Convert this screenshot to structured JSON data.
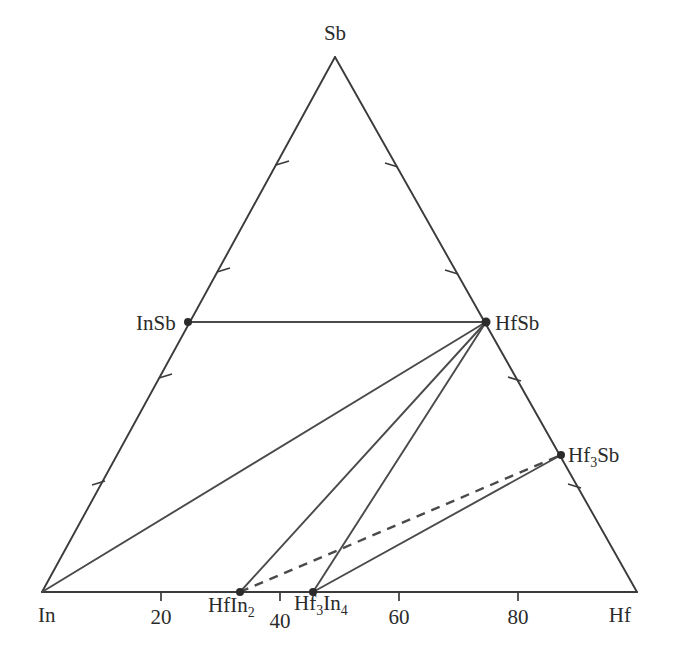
{
  "figure": {
    "kind": "ternary-phase-diagram",
    "system": "In-Hf-Sb",
    "background_color": "#ffffff",
    "line_color": "#3b3b3b",
    "dot_color": "#2b2b2b"
  },
  "corners": {
    "top": {
      "label": "Sb",
      "x": 335,
      "y": 40
    },
    "bottom_left": {
      "label": "In",
      "x": 38,
      "y": 622
    },
    "bottom_right": {
      "label": "Hf",
      "x": 631,
      "y": 622
    }
  },
  "axis_ticks": {
    "bottom_numbers": [
      {
        "label": "20",
        "value": 20,
        "x": 161,
        "y": 624
      },
      {
        "label": "40",
        "value": 40,
        "x": 279,
        "y": 628
      },
      {
        "label": "60",
        "value": 60,
        "x": 396,
        "y": 624
      },
      {
        "label": "80",
        "value": 80,
        "x": 514,
        "y": 624
      }
    ],
    "tick_values": [
      20,
      40,
      60,
      80
    ]
  },
  "phases": [
    {
      "id": "InSb",
      "base": "InSb",
      "sub": "",
      "tail": "",
      "x": 188,
      "y": 322,
      "label_x": 136,
      "label_y": 329,
      "label_anchor": "start"
    },
    {
      "id": "HfSb",
      "base": "HfSb",
      "sub": "",
      "tail": "",
      "x": 486,
      "y": 322,
      "label_x": 496,
      "label_y": 329,
      "label_anchor": "start"
    },
    {
      "id": "Hf3Sb",
      "base": "Hf",
      "sub": "3",
      "tail": "Sb",
      "x": 561,
      "y": 455,
      "label_x": 569,
      "label_y": 462,
      "label_anchor": "start"
    },
    {
      "id": "HfIn2",
      "base": "HfIn",
      "sub": "2",
      "tail": "",
      "x": 240,
      "y": 592,
      "label_x": 209,
      "label_y": 612,
      "label_anchor": "start"
    },
    {
      "id": "Hf3In4",
      "base": "Hf",
      "sub": "3",
      "tail": "In",
      "tail_sub": "4",
      "x": 313,
      "y": 592,
      "label_x": 295,
      "label_y": 612,
      "label_anchor": "start"
    }
  ],
  "tie_lines": [
    {
      "from": "InSb",
      "to": "HfSb",
      "style": "solid"
    },
    {
      "from": "In",
      "to": "HfSb",
      "style": "solid"
    },
    {
      "from": "HfIn2",
      "to": "HfSb",
      "style": "solid"
    },
    {
      "from": "Hf3In4",
      "to": "HfSb",
      "style": "solid"
    },
    {
      "from": "Hf3In4",
      "to": "Hf3Sb",
      "style": "solid"
    },
    {
      "from": "HfIn2",
      "to": "Hf3Sb",
      "style": "dashed"
    }
  ]
}
